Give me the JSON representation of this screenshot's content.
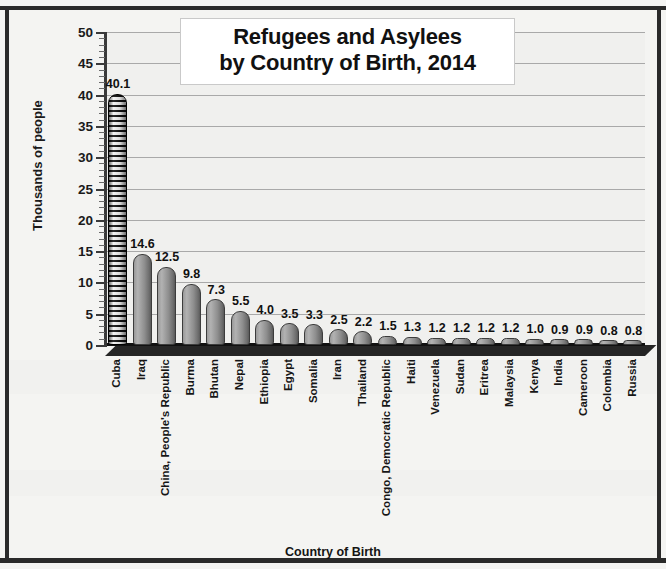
{
  "chart_data": {
    "type": "bar",
    "title": "Refugees and Asylees by Country of Birth, 2014",
    "title_line1": "Refugees and Asylees",
    "title_line2": "by Country of Birth, 2014",
    "xlabel": "Country of Birth",
    "ylabel": "Thousands of people",
    "ylim": [
      0,
      50
    ],
    "ytick_step": 5,
    "yticks": [
      "0",
      "5",
      "10",
      "15",
      "20",
      "25",
      "30",
      "35",
      "40",
      "45",
      "50"
    ],
    "grid": true,
    "legend": "none",
    "categories": [
      "Cuba",
      "Iraq",
      "China, People's Republic",
      "Burma",
      "Bhutan",
      "Nepal",
      "Ethiopia",
      "Egypt",
      "Somalia",
      "Iran",
      "Thailand",
      "Congo, Democratic Republic",
      "Haiti",
      "Venezuela",
      "Sudan",
      "Eritrea",
      "Malaysia",
      "Kenya",
      "India",
      "Cameroon",
      "Colombia",
      "Russia"
    ],
    "values": [
      40.1,
      14.6,
      12.5,
      9.8,
      7.3,
      5.5,
      4.0,
      3.5,
      3.3,
      2.5,
      2.2,
      1.5,
      1.3,
      1.2,
      1.2,
      1.2,
      1.2,
      1.0,
      0.9,
      0.9,
      0.8,
      0.8
    ],
    "value_labels": [
      "40.1",
      "14.6",
      "12.5",
      "9.8",
      "7.3",
      "5.5",
      "4.0",
      "3.5",
      "3.3",
      "2.5",
      "2.2",
      "1.5",
      "1.3",
      "1.2",
      "1.2",
      "1.2",
      "1.2",
      "1.0",
      "0.9",
      "0.9",
      "0.8",
      "0.8"
    ],
    "highlighted_index": 0,
    "highlight_style": "black-and-white-striped-cylinder",
    "bar_style": "gray-3d-cylinder",
    "colors": {
      "bar_fill": "#9a9a9a",
      "bar_edge": "#3c3c3c",
      "highlight_dark": "#111111",
      "highlight_light": "#f2f2f2",
      "gridline": "#a9a9a9",
      "plot_background": "#f0f0ee",
      "page_background": "#f4f4f2",
      "text": "#111111"
    }
  }
}
